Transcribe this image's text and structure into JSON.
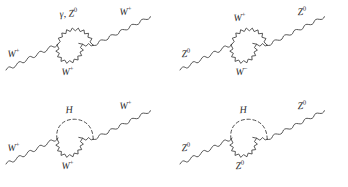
{
  "figure": {
    "background_color": "#ffffff",
    "line_color": "#3a3a3a",
    "label_color": "#2f2f2f",
    "caption": "",
    "layout": "2x2 grid of one-loop self-energy Feynman diagrams"
  },
  "diagrams": [
    {
      "id": "top-left",
      "position": "top-left",
      "incoming_label": "W",
      "incoming_charge": "+",
      "outgoing_label": "W",
      "outgoing_charge": "+",
      "loop_top_label": "γ, Z",
      "loop_top_charge": "0",
      "loop_bottom_label": "W",
      "loop_bottom_charge": "+",
      "loop_top_style": "wavy",
      "loop_bottom_style": "wavy"
    },
    {
      "id": "top-right",
      "position": "top-right",
      "incoming_label": "Z",
      "incoming_charge": "0",
      "outgoing_label": "Z",
      "outgoing_charge": "0",
      "loop_top_label": "W",
      "loop_top_charge": "+",
      "loop_bottom_label": "W",
      "loop_bottom_charge": "−",
      "loop_top_style": "wavy",
      "loop_bottom_style": "wavy"
    },
    {
      "id": "bottom-left",
      "position": "bottom-left",
      "incoming_label": "W",
      "incoming_charge": "+",
      "outgoing_label": "W",
      "outgoing_charge": "+",
      "loop_top_label": "H",
      "loop_top_charge": "",
      "loop_bottom_label": "W",
      "loop_bottom_charge": "+",
      "loop_top_style": "dashed",
      "loop_bottom_style": "wavy"
    },
    {
      "id": "bottom-right",
      "position": "bottom-right",
      "incoming_label": "Z",
      "incoming_charge": "0",
      "outgoing_label": "Z",
      "outgoing_charge": "0",
      "loop_top_label": "H",
      "loop_top_charge": "",
      "loop_bottom_label": "Z",
      "loop_bottom_charge": "0",
      "loop_top_style": "dashed",
      "loop_bottom_style": "wavy"
    }
  ]
}
